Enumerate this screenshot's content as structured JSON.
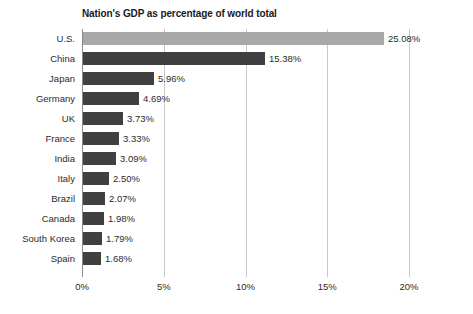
{
  "chart_data": {
    "type": "bar",
    "orientation": "horizontal",
    "title": "Nation's GDP as percentage of world total",
    "xlabel": "",
    "ylabel": "",
    "grid": true,
    "legend": "none",
    "xlim": [
      0,
      20
    ],
    "x_ticks": [
      "0%",
      "5%",
      "10%",
      "15%",
      "20%"
    ],
    "x_tick_values": [
      0,
      5,
      10,
      15,
      20
    ],
    "categories": [
      "U.S.",
      "China",
      "Japan",
      "Germany",
      "UK",
      "France",
      "India",
      "Italy",
      "Brazil",
      "Canada",
      "South Korea",
      "Spain"
    ],
    "values": [
      25.08,
      15.38,
      5.96,
      4.69,
      3.73,
      3.33,
      3.09,
      2.5,
      2.07,
      1.98,
      1.79,
      1.68
    ],
    "value_labels": [
      "25.08%",
      "15.38%",
      "5.96%",
      "4.69%",
      "3.73%",
      "3.33%",
      "3.09%",
      "2.50%",
      "2.07%",
      "1.98%",
      "1.79%",
      "1.68%"
    ],
    "drawn_lengths_px": [
      301,
      182,
      71,
      56,
      40,
      36,
      33,
      26,
      22,
      21,
      19,
      18
    ],
    "highlight_index": 0,
    "colors": {
      "bar": "#404040",
      "bar_highlight": "#a8a8a8",
      "gridline": "#c9c9c9",
      "axis": "#8a8a8a",
      "text": "#2b2b2b",
      "title": "#1a1a1a",
      "background": "#ffffff"
    }
  }
}
